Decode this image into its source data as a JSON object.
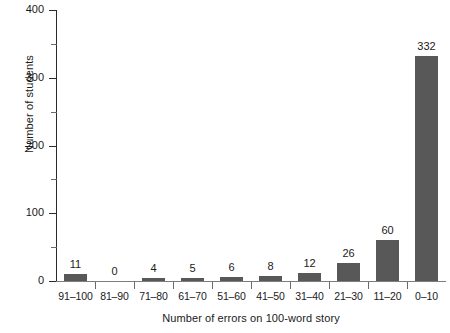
{
  "chart_data": {
    "type": "bar",
    "title": "",
    "xlabel": "Number of errors on 100-word story",
    "ylabel": "Number of students",
    "categories": [
      "91–100",
      "81–90",
      "71–80",
      "61–70",
      "51–60",
      "41–50",
      "31–40",
      "21–30",
      "11–20",
      "0–10"
    ],
    "values": [
      11,
      0,
      4,
      5,
      6,
      8,
      12,
      26,
      60,
      332
    ],
    "value_labels": [
      "11",
      "0",
      "4",
      "5",
      "6",
      "8",
      "12",
      "26",
      "60",
      "332"
    ],
    "ylim": [
      0,
      400
    ],
    "y_ticks": [
      0,
      100,
      200,
      300,
      400
    ],
    "y_tick_labels": [
      "0",
      "100",
      "200",
      "300",
      "400"
    ],
    "y_minor_ticks": [
      50,
      150,
      250,
      350
    ],
    "grid": false,
    "legend": false,
    "bar_color": "#585858",
    "axis_color": "#2b2b2b",
    "background_color": "#ffffff"
  }
}
